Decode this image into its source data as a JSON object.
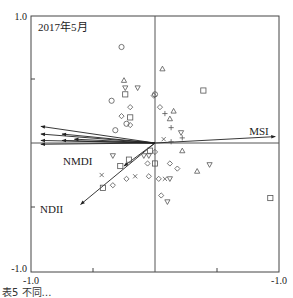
{
  "chart_data": {
    "type": "scatter",
    "subtype": "biplot",
    "title": "2017年5月",
    "xlabel": "",
    "ylabel": "",
    "xlim": [
      -1.0,
      1.0
    ],
    "ylim": [
      -1.0,
      1.0
    ],
    "x_tick_labels": [
      "-1.0",
      "-1.0"
    ],
    "y_tick_labels": [
      "1.0",
      "-1.0"
    ],
    "grid": false,
    "axes_lines": {
      "x0": true,
      "y0": true
    },
    "frame": {
      "left": 31,
      "top": 16,
      "right": 279,
      "bottom": 272,
      "origin_x": 155,
      "origin_y": 143
    },
    "vectors": [
      {
        "label": "MSI",
        "x": 0.97,
        "y": 0.05
      },
      {
        "label": "NMDI",
        "x": -0.25,
        "y": -0.18
      },
      {
        "label": "NDII",
        "x": -0.6,
        "y": -0.48
      },
      {
        "label": "",
        "x": -0.92,
        "y": 0.13
      },
      {
        "label": "",
        "x": -0.92,
        "y": 0.07
      },
      {
        "label": "",
        "x": -0.92,
        "y": 0.02
      },
      {
        "label": "",
        "x": -0.92,
        "y": -0.01
      },
      {
        "label": "",
        "x": -0.75,
        "y": 0.07
      },
      {
        "label": "",
        "x": -0.75,
        "y": 0.02
      },
      {
        "label": "",
        "x": -0.65,
        "y": 0.03
      }
    ],
    "points": [
      {
        "shape": "circle",
        "x": -0.27,
        "y": 0.75
      },
      {
        "shape": "triangle",
        "x": 0.06,
        "y": 0.58
      },
      {
        "shape": "square",
        "x": 0.39,
        "y": 0.41
      },
      {
        "shape": "triangle",
        "x": -0.25,
        "y": 0.49
      },
      {
        "shape": "square",
        "x": -0.24,
        "y": 0.38
      },
      {
        "shape": "triangle-down",
        "x": -0.24,
        "y": 0.43
      },
      {
        "shape": "triangle-down",
        "x": -0.14,
        "y": 0.43
      },
      {
        "shape": "circle",
        "x": -0.35,
        "y": 0.33
      },
      {
        "shape": "diamond",
        "x": -0.2,
        "y": 0.28
      },
      {
        "shape": "diamond",
        "x": -0.27,
        "y": 0.21
      },
      {
        "shape": "square",
        "x": -0.2,
        "y": 0.2
      },
      {
        "shape": "diamond",
        "x": -0.2,
        "y": 0.14
      },
      {
        "shape": "circle",
        "x": -0.23,
        "y": 0.15
      },
      {
        "shape": "circle",
        "x": -0.32,
        "y": 0.1
      },
      {
        "shape": "diamond",
        "x": 0.04,
        "y": 0.28
      },
      {
        "shape": "circle",
        "x": 0.0,
        "y": 0.38
      },
      {
        "shape": "diamond",
        "x": -0.01,
        "y": 0.37
      },
      {
        "shape": "plus",
        "x": 0.08,
        "y": 0.23
      },
      {
        "shape": "triangle",
        "x": 0.15,
        "y": 0.25
      },
      {
        "shape": "triangle",
        "x": 0.12,
        "y": 0.19
      },
      {
        "shape": "plus",
        "x": 0.13,
        "y": 0.12
      },
      {
        "shape": "triangle-down",
        "x": 0.21,
        "y": 0.08
      },
      {
        "shape": "plus",
        "x": 0.22,
        "y": 0.04
      },
      {
        "shape": "cross",
        "x": 0.07,
        "y": 0.03
      },
      {
        "shape": "plus",
        "x": 0.13,
        "y": 0.01
      },
      {
        "shape": "square",
        "x": -0.21,
        "y": -0.13
      },
      {
        "shape": "triangle-down",
        "x": -0.34,
        "y": -0.1
      },
      {
        "shape": "square",
        "x": -0.28,
        "y": -0.18
      },
      {
        "shape": "triangle-down",
        "x": -0.05,
        "y": -0.1
      },
      {
        "shape": "triangle-down",
        "x": -0.09,
        "y": -0.1
      },
      {
        "shape": "diamond",
        "x": -0.06,
        "y": -0.16
      },
      {
        "shape": "diamond",
        "x": 0.0,
        "y": -0.07
      },
      {
        "shape": "diamond",
        "x": 0.12,
        "y": -0.16
      },
      {
        "shape": "diamond",
        "x": 0.18,
        "y": -0.2
      },
      {
        "shape": "triangle",
        "x": 0.22,
        "y": -0.06
      },
      {
        "shape": "triangle",
        "x": 0.34,
        "y": -0.22
      },
      {
        "shape": "triangle-down",
        "x": 0.44,
        "y": -0.17
      },
      {
        "shape": "square",
        "x": -0.42,
        "y": -0.35
      },
      {
        "shape": "diamond",
        "x": -0.34,
        "y": -0.33
      },
      {
        "shape": "diamond",
        "x": -0.23,
        "y": -0.28
      },
      {
        "shape": "cross",
        "x": -0.16,
        "y": -0.26
      },
      {
        "shape": "cross",
        "x": -0.43,
        "y": -0.25
      },
      {
        "shape": "diamond",
        "x": -0.05,
        "y": -0.26
      },
      {
        "shape": "diamond",
        "x": 0.03,
        "y": -0.28
      },
      {
        "shape": "cross",
        "x": 0.08,
        "y": -0.28
      },
      {
        "shape": "triangle-down",
        "x": 0.12,
        "y": -0.28
      },
      {
        "shape": "diamond",
        "x": 0.05,
        "y": -0.41
      },
      {
        "shape": "triangle-down",
        "x": 0.1,
        "y": -0.46
      },
      {
        "shape": "square",
        "x": 0.93,
        "y": -0.43
      },
      {
        "shape": "square",
        "x": -0.04,
        "y": -0.06
      },
      {
        "shape": "square",
        "x": 0.0,
        "y": -0.16
      }
    ]
  },
  "labels": {
    "title": "2017年5月",
    "y_top": "1.0",
    "y_bottom": "-1.0",
    "x_left": "-1.0",
    "x_right": "-1.0",
    "msi": "MSI",
    "nmdi": "NMDI",
    "ndii": "NDII"
  },
  "caption": "表5 不同…"
}
